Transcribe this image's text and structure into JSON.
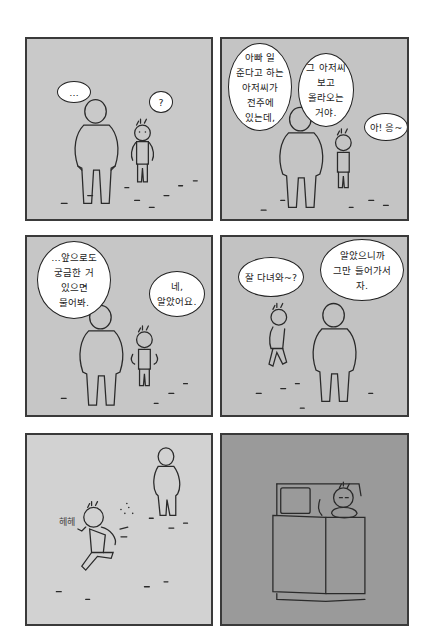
{
  "comic": {
    "background_color": "#ffffff",
    "panel_border_color": "#3a3a3a",
    "panels": [
      {
        "id": 1,
        "bg_color": "#c9c9c9",
        "bubbles": [
          {
            "speaker": "father",
            "text": "…"
          },
          {
            "speaker": "child",
            "text": "?"
          }
        ]
      },
      {
        "id": 2,
        "bg_color": "#c4c4c4",
        "bubbles": [
          {
            "speaker": "father",
            "text": "아빠 일\n준다고 하는\n아저씨가\n전주에\n있는데,"
          },
          {
            "speaker": "father",
            "text": "그 아저씨\n보고\n올라오는\n거야."
          },
          {
            "speaker": "child",
            "text": "아! 응~"
          }
        ]
      },
      {
        "id": 3,
        "bg_color": "#c6c6c6",
        "bubbles": [
          {
            "speaker": "father",
            "text": "…앞으로도\n궁금한 거\n있으면\n물어봐."
          },
          {
            "speaker": "child",
            "text": "네,\n알았어요."
          }
        ]
      },
      {
        "id": 4,
        "bg_color": "#c2c2c2",
        "bubbles": [
          {
            "speaker": "child",
            "text": "잘 다녀와~?"
          },
          {
            "speaker": "father",
            "text": "알았으니까\n그만 들어가서\n자."
          }
        ]
      },
      {
        "id": 5,
        "bg_color": "#d2d2d2",
        "sfx": "헤헤"
      },
      {
        "id": 6,
        "bg_color": "#9a9a9a",
        "description": "child sleeping in bed, top-down view"
      }
    ]
  }
}
